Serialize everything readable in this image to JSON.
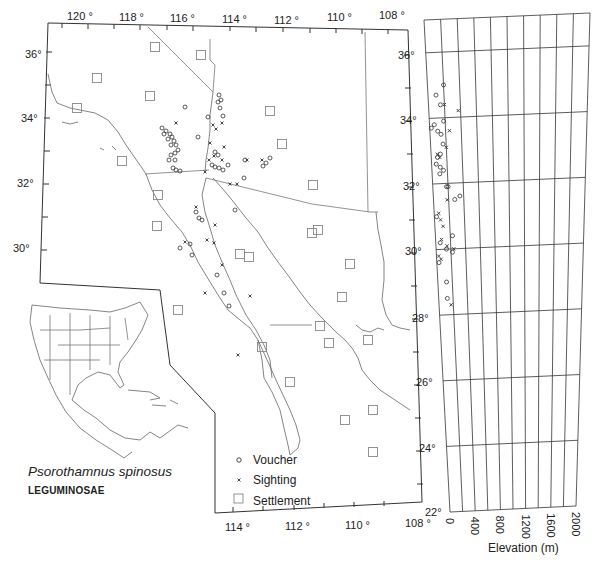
{
  "title": {
    "species": "Psorothamnus spinosus",
    "family": "LEGUMINOSAE"
  },
  "map": {
    "longitude_top_labels": [
      "120 °",
      "118 °",
      "116 °",
      "114 °",
      "112 °",
      "110 °",
      "108 °"
    ],
    "longitude_bottom_labels": [
      "114 °",
      "112 °",
      "110 °",
      "108 °"
    ],
    "latitude_left_labels": [
      "36°",
      "34°",
      "32°",
      "30°"
    ],
    "latitude_right_labels": [
      "36°",
      "34°",
      "32°",
      "30°",
      "28°",
      "26°",
      "24°",
      "22°"
    ],
    "legend": [
      {
        "symbol": "circle-icon",
        "label": "Voucher"
      },
      {
        "symbol": "x-icon",
        "label": "Sighting"
      },
      {
        "symbol": "square-icon",
        "label": "Settlement"
      }
    ]
  },
  "chart_data": {
    "type": "scatter",
    "title": "",
    "xlabel": "Elevation (m)",
    "ylabel": "Latitude",
    "x_ticks": [
      "0",
      "400",
      "800",
      "1200",
      "1600",
      "2000"
    ],
    "y_ticks": [
      "36°",
      "34°",
      "32°",
      "30°",
      "28°",
      "26°",
      "24°",
      "22°"
    ],
    "xlim": [
      0,
      2000
    ],
    "ylim": [
      22,
      37
    ],
    "grid": true,
    "series": [
      {
        "name": "Voucher",
        "points": [
          [
            200,
            35.0
          ],
          [
            100,
            34.7
          ],
          [
            150,
            34.4
          ],
          [
            180,
            33.9
          ],
          [
            20,
            33.7
          ],
          [
            60,
            33.8
          ],
          [
            100,
            33.6
          ],
          [
            140,
            33.5
          ],
          [
            160,
            33.2
          ],
          [
            120,
            32.9
          ],
          [
            80,
            32.8
          ],
          [
            60,
            32.6
          ],
          [
            110,
            32.5
          ],
          [
            150,
            32.4
          ],
          [
            100,
            32.3
          ],
          [
            180,
            31.9
          ],
          [
            200,
            31.9
          ],
          [
            350,
            31.6
          ],
          [
            280,
            31.5
          ],
          [
            30,
            31.0
          ],
          [
            230,
            30.4
          ],
          [
            60,
            30.2
          ],
          [
            140,
            30.0
          ],
          [
            220,
            29.9
          ],
          [
            30,
            29.6
          ],
          [
            120,
            29.0
          ],
          [
            120,
            28.5
          ]
        ],
        "marker": "circle"
      },
      {
        "name": "Sighting",
        "points": [
          [
            200,
            34.4
          ],
          [
            370,
            34.2
          ],
          [
            250,
            33.6
          ],
          [
            200,
            33.1
          ],
          [
            80,
            32.9
          ],
          [
            110,
            32.8
          ],
          [
            180,
            31.5
          ],
          [
            60,
            31.1
          ],
          [
            80,
            30.9
          ],
          [
            110,
            30.7
          ],
          [
            80,
            30.3
          ],
          [
            150,
            30.1
          ],
          [
            240,
            30.0
          ],
          [
            30,
            29.8
          ],
          [
            60,
            29.7
          ],
          [
            170,
            28.3
          ]
        ],
        "marker": "x"
      }
    ]
  }
}
